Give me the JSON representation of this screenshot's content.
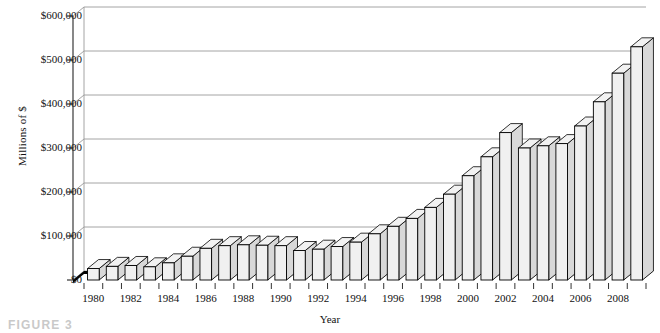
{
  "figure": {
    "caption": "FIGURE 3"
  },
  "chart_data": {
    "type": "bar",
    "title": "",
    "xlabel": "Year",
    "ylabel": "Millions of $",
    "ylim": [
      0,
      600000
    ],
    "ytick_labels": [
      "$600,000",
      "$500,000",
      "$400,000",
      "$300,000",
      "$200,000",
      "$100,000",
      "$0"
    ],
    "ytick_values": [
      600000,
      500000,
      400000,
      300000,
      200000,
      100000,
      0
    ],
    "grid": true,
    "legend": "none",
    "style": "3d-column",
    "xtick_labels": [
      "1980",
      "1982",
      "1984",
      "1986",
      "1988",
      "1990",
      "1992",
      "1994",
      "1996",
      "1998",
      "2000",
      "2002",
      "2004",
      "2006",
      "2008"
    ],
    "categories": [
      "1980",
      "1981",
      "1982",
      "1983",
      "1984",
      "1985",
      "1986",
      "1987",
      "1988",
      "1989",
      "1990",
      "1991",
      "1992",
      "1993",
      "1994",
      "1995",
      "1996",
      "1997",
      "1998",
      "1999",
      "2000",
      "2001",
      "2002",
      "2003",
      "2004",
      "2005",
      "2006",
      "2007",
      "2008",
      "2009"
    ],
    "values": [
      26000,
      31000,
      33000,
      30000,
      39000,
      54000,
      72000,
      78000,
      80000,
      79000,
      78000,
      67000,
      70000,
      76000,
      86000,
      105000,
      122000,
      140000,
      165000,
      195000,
      237000,
      280000,
      335000,
      300000,
      305000,
      310000,
      350000,
      405000,
      470000,
      530000
    ],
    "series_note": "One bar per year 1980-2009"
  }
}
